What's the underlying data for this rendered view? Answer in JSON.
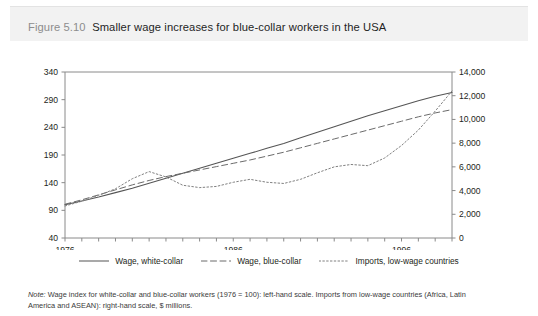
{
  "figure": {
    "number": "Figure 5.10",
    "title": "Smaller wage increases for blue-collar workers in the USA",
    "note_label": "Note:",
    "note_text": " Wage index for white-collar and blue-collar workers (1976 = 100): left-hand scale. Imports from low-wage countries (Africa, Latin America and ASEAN): right-hand scale, $ millions."
  },
  "legend": {
    "position": "bottom-center",
    "entries": [
      {
        "label": "Wage, white-collar",
        "style": "solid",
        "color": "#555555"
      },
      {
        "label": "Wage, blue-collar",
        "style": "dashed",
        "color": "#6b6b6b"
      },
      {
        "label": "Imports, low-wage countries",
        "style": "dotted",
        "color": "#808080"
      }
    ]
  },
  "chart_data": {
    "type": "line",
    "title": "Smaller wage increases for blue-collar workers in the USA",
    "xlabel": "",
    "ylabel": "",
    "y2label": "",
    "grid": false,
    "xlim": [
      1976,
      1999
    ],
    "ylim": [
      40,
      340
    ],
    "y2lim": [
      0,
      14000
    ],
    "yticks": [
      40,
      90,
      140,
      190,
      240,
      290,
      340
    ],
    "ytick_labels": [
      "40",
      "90",
      "140",
      "190",
      "240",
      "290",
      "340"
    ],
    "y2ticks": [
      0,
      2000,
      4000,
      6000,
      8000,
      10000,
      12000,
      14000
    ],
    "y2tick_labels": [
      "0",
      "2,000",
      "4,000",
      "6,000",
      "8,000",
      "10,000",
      "12,000",
      "14,000"
    ],
    "x": [
      1976,
      1977,
      1978,
      1979,
      1980,
      1981,
      1982,
      1983,
      1984,
      1985,
      1986,
      1987,
      1988,
      1989,
      1990,
      1991,
      1992,
      1993,
      1994,
      1995,
      1996,
      1997,
      1998,
      1999
    ],
    "xticks": [
      1976,
      1977,
      1978,
      1979,
      1980,
      1981,
      1982,
      1983,
      1984,
      1985,
      1986,
      1987,
      1988,
      1989,
      1990,
      1991,
      1992,
      1993,
      1994,
      1995,
      1996,
      1997,
      1998,
      1999
    ],
    "xtick_labels_shown": [
      "1976",
      "1986",
      "1996"
    ],
    "xtick_labels_shown_at": [
      1976,
      1986,
      1996
    ],
    "series": [
      {
        "name": "Wage, white-collar",
        "axis": "left",
        "style": "solid",
        "color": "#555555",
        "values": [
          100,
          107,
          114,
          122,
          130,
          139,
          148,
          157,
          166,
          175,
          184,
          193,
          202,
          211,
          221,
          231,
          241,
          251,
          261,
          270,
          279,
          288,
          296,
          303
        ]
      },
      {
        "name": "Wage, blue-collar",
        "axis": "left",
        "style": "dashed",
        "color": "#6b6b6b",
        "values": [
          101,
          109,
          118,
          127,
          136,
          144,
          151,
          157,
          163,
          169,
          175,
          181,
          188,
          195,
          203,
          211,
          219,
          227,
          235,
          243,
          251,
          259,
          266,
          272
        ]
      },
      {
        "name": "Imports, low-wage countries",
        "axis": "right",
        "style": "dotted",
        "color": "#808080",
        "values": [
          2700,
          3100,
          3600,
          4150,
          5000,
          5600,
          5150,
          4450,
          4250,
          4350,
          4700,
          4950,
          4700,
          4600,
          4950,
          5500,
          6000,
          6200,
          6100,
          6750,
          7800,
          9100,
          10700,
          12400
        ]
      }
    ]
  }
}
